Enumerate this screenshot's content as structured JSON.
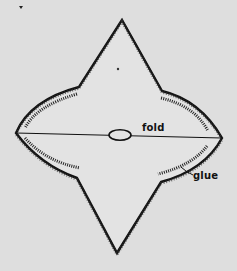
{
  "diagram": {
    "kind": "paper-craft cutting pattern",
    "shape": "four-pointed star with concave curved sides",
    "colors": {
      "background": "#dedede",
      "paper": "#e4e4e4",
      "ink": "#111111"
    },
    "vertices": {
      "top": [
        122,
        20
      ],
      "left": [
        16,
        133
      ],
      "right": [
        222,
        138
      ],
      "bottom": [
        117,
        253
      ],
      "upper_left_inner": [
        79,
        87
      ],
      "upper_right_inner": [
        162,
        91
      ],
      "lower_left_inner": [
        77,
        178
      ],
      "lower_right_inner": [
        161,
        182
      ]
    },
    "labels": {
      "fold": "fold",
      "glue": "glue"
    },
    "fold_line": {
      "from": [
        16,
        133
      ],
      "to": [
        222,
        138
      ],
      "ellipse_center": [
        120,
        135
      ],
      "ellipse_size": [
        22,
        10
      ]
    },
    "marks": {
      "center_dot": [
        118,
        69
      ],
      "corner_mark": [
        21,
        7
      ]
    }
  }
}
